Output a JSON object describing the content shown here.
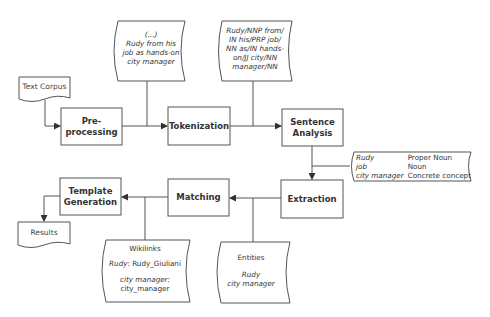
{
  "diagram": {
    "inputs": {
      "text_corpus": "Text Corpus",
      "results": "Results"
    },
    "steps": [
      {
        "id": "preprocessing",
        "label_lines": [
          "Pre-",
          "processing"
        ]
      },
      {
        "id": "tokenization",
        "label_lines": [
          "Tokenization"
        ]
      },
      {
        "id": "sentence_analysis",
        "label_lines": [
          "Sentence",
          "Analysis"
        ]
      },
      {
        "id": "extraction",
        "label_lines": [
          "Extraction"
        ]
      },
      {
        "id": "matching",
        "label_lines": [
          "Matching"
        ]
      },
      {
        "id": "template_generation",
        "label_lines": [
          "Template",
          "Generation"
        ]
      }
    ],
    "notes": {
      "raw_text": {
        "lines": [
          "(...)",
          "Rudy from his",
          "job as hands-on",
          "city manager"
        ]
      },
      "tagged": {
        "lines": [
          "Rudy/NNP from/",
          "IN his/PRP job/",
          "NN as/IN hands-",
          "on/JJ city/NN",
          "manager/NN"
        ]
      },
      "pos": {
        "rows": [
          {
            "term": "Rudy",
            "type": "Proper Noun"
          },
          {
            "term": "job",
            "type": "Noun"
          },
          {
            "term": "city manager",
            "type": "Concrete concept"
          }
        ]
      },
      "entities": {
        "title": "Entities",
        "items": [
          "Rudy",
          "city manager"
        ]
      },
      "wikilinks": {
        "title": "Wikilinks",
        "entries": [
          {
            "term": "Rudy",
            "link": "Rudy_Giuliani"
          },
          {
            "term": "city manager",
            "link": "city_manager"
          }
        ]
      }
    }
  }
}
